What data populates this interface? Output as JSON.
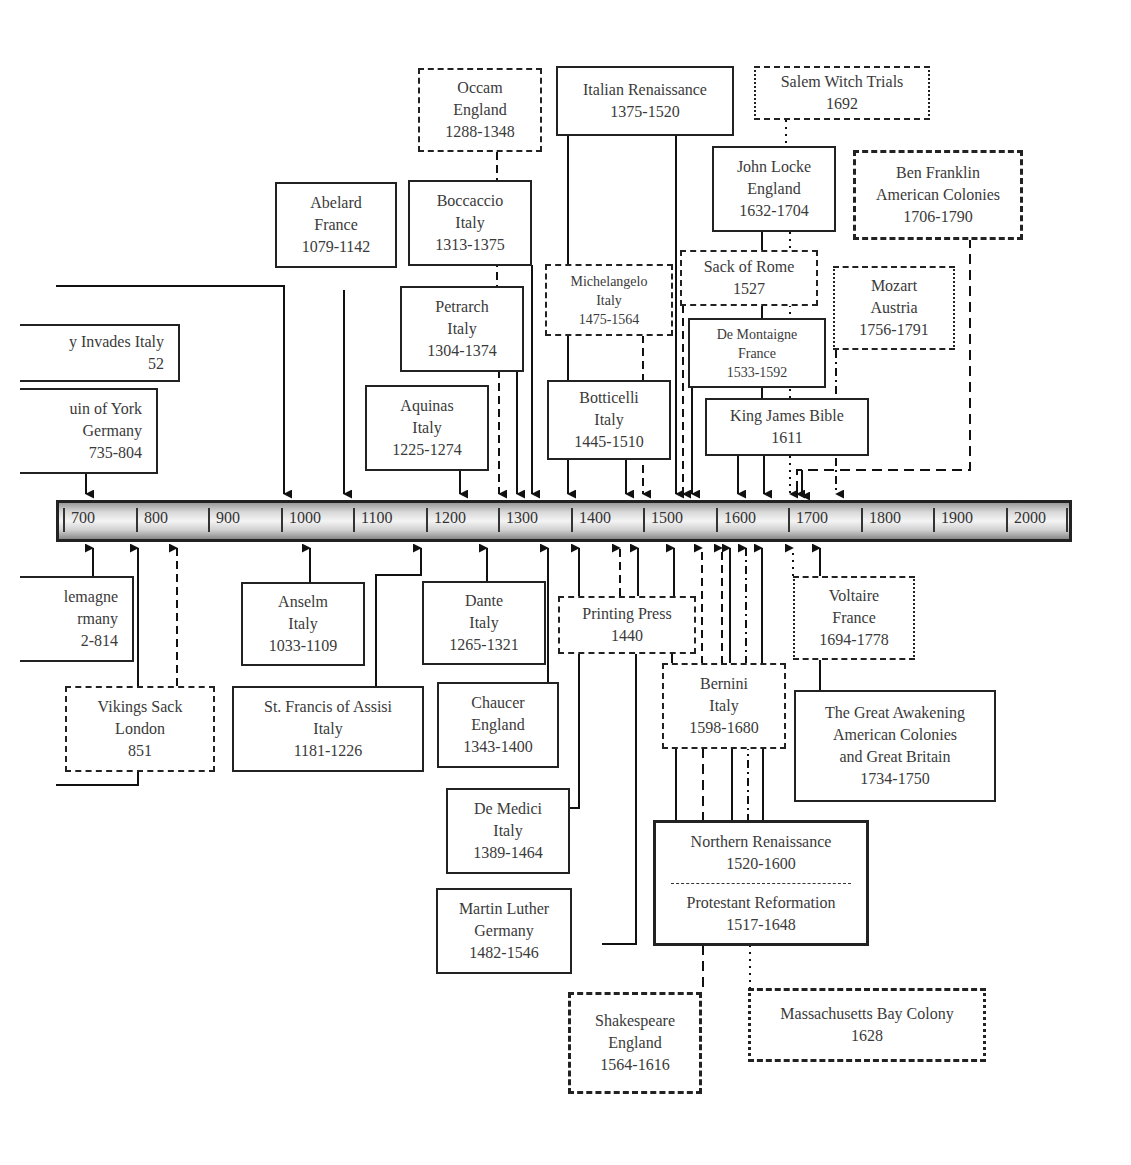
{
  "timeline": {
    "ticks": [
      "700",
      "800",
      "900",
      "1000",
      "1100",
      "1200",
      "1300",
      "1400",
      "1500",
      "1600",
      "1700",
      "1800",
      "1900",
      "2000"
    ]
  },
  "events_above": [
    {
      "id": "occam",
      "lines": [
        "Occam",
        "England",
        "1288-1348"
      ],
      "style": "dashed"
    },
    {
      "id": "italian_renaissance",
      "lines": [
        "Italian Renaissance",
        "1375-1520"
      ],
      "style": "solid"
    },
    {
      "id": "salem",
      "lines": [
        "Salem Witch Trials",
        "1692"
      ],
      "style": "dotdash"
    },
    {
      "id": "abelard",
      "lines": [
        "Abelard",
        "France",
        "1079-1142"
      ],
      "style": "solid"
    },
    {
      "id": "boccaccio",
      "lines": [
        "Boccaccio",
        "Italy",
        "1313-1375"
      ],
      "style": "solid"
    },
    {
      "id": "john_locke",
      "lines": [
        "John Locke",
        "England",
        "1632-1704"
      ],
      "style": "solid"
    },
    {
      "id": "ben_franklin",
      "lines": [
        "Ben Franklin",
        "American Colonies",
        "1706-1790"
      ],
      "style": "dashed"
    },
    {
      "id": "michelangelo",
      "lines": [
        "Michelangelo",
        "Italy",
        "1475-1564"
      ],
      "style": "dashed"
    },
    {
      "id": "sack_of_rome",
      "lines": [
        "Sack of Rome",
        "1527"
      ],
      "style": "dashed"
    },
    {
      "id": "mozart",
      "lines": [
        "Mozart",
        "Austria",
        "1756-1791"
      ],
      "style": "dotdash"
    },
    {
      "id": "petrarch",
      "lines": [
        "Petrarch",
        "Italy",
        "1304-1374"
      ],
      "style": "solid"
    },
    {
      "id": "de_montaigne",
      "lines": [
        "De Montaigne",
        "France",
        "1533-1592"
      ],
      "style": "solid"
    },
    {
      "id": "invades_italy",
      "lines": [
        "y Invades Italy",
        "52"
      ],
      "style": "solid"
    },
    {
      "id": "alcuin",
      "lines": [
        "uin of York",
        "Germany",
        "735-804"
      ],
      "style": "solid"
    },
    {
      "id": "aquinas",
      "lines": [
        "Aquinas",
        "Italy",
        "1225-1274"
      ],
      "style": "solid"
    },
    {
      "id": "botticelli",
      "lines": [
        "Botticelli",
        "Italy",
        "1445-1510"
      ],
      "style": "solid"
    },
    {
      "id": "king_james",
      "lines": [
        "King James Bible",
        "1611"
      ],
      "style": "solid"
    }
  ],
  "events_below": [
    {
      "id": "charlemagne",
      "lines": [
        "lemagne",
        "rmany",
        "2-814"
      ],
      "style": "solid"
    },
    {
      "id": "anselm",
      "lines": [
        "Anselm",
        "Italy",
        "1033-1109"
      ],
      "style": "solid"
    },
    {
      "id": "dante",
      "lines": [
        "Dante",
        "Italy",
        "1265-1321"
      ],
      "style": "solid"
    },
    {
      "id": "printing_press",
      "lines": [
        "Printing Press",
        "1440"
      ],
      "style": "dashed"
    },
    {
      "id": "voltaire",
      "lines": [
        "Voltaire",
        "France",
        "1694-1778"
      ],
      "style": "dotdash"
    },
    {
      "id": "vikings",
      "lines": [
        "Vikings Sack",
        "London",
        "851"
      ],
      "style": "dashed"
    },
    {
      "id": "st_francis",
      "lines": [
        "St. Francis of Assisi",
        "Italy",
        "1181-1226"
      ],
      "style": "solid"
    },
    {
      "id": "chaucer",
      "lines": [
        "Chaucer",
        "England",
        "1343-1400"
      ],
      "style": "solid"
    },
    {
      "id": "bernini",
      "lines": [
        "Bernini",
        "Italy",
        "1598-1680"
      ],
      "style": "dashed"
    },
    {
      "id": "great_awakening",
      "lines": [
        "The Great Awakening",
        "American Colonies",
        "and Great Britain",
        "1734-1750"
      ],
      "style": "solid"
    },
    {
      "id": "de_medici",
      "lines": [
        "De Medici",
        "Italy",
        "1389-1464"
      ],
      "style": "solid"
    },
    {
      "id": "martin_luther",
      "lines": [
        "Martin Luther",
        "Germany",
        "1482-1546"
      ],
      "style": "solid"
    },
    {
      "id": "northern_renaissance",
      "lines": [
        "Northern Renaissance",
        "1520-1600"
      ],
      "lines2": [
        "Protestant Reformation",
        "1517-1648"
      ],
      "style": "solid"
    },
    {
      "id": "shakespeare",
      "lines": [
        "Shakespeare",
        "England",
        "1564-1616"
      ],
      "style": "dashed"
    },
    {
      "id": "massachusetts",
      "lines": [
        "Massachusetts Bay Colony",
        "1628"
      ],
      "style": "dotdash"
    }
  ]
}
